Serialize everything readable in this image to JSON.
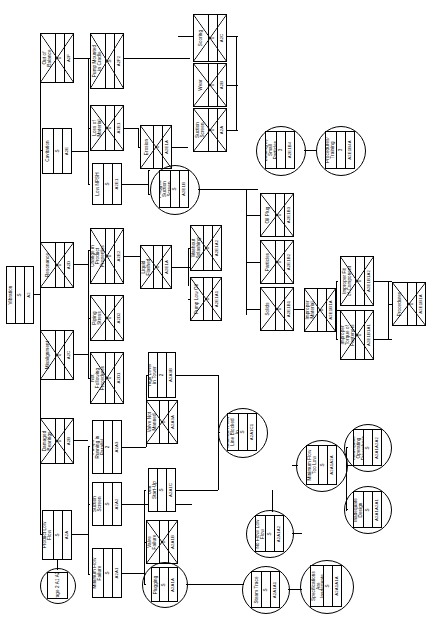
{
  "diagram": {
    "orientation": "landscape-rotated-text",
    "root": {
      "name": "Vibration",
      "rank": "S",
      "code": "A2"
    },
    "nodes": [
      {
        "id": "n_root",
        "name": "Vibration",
        "rank": "S",
        "code": "A2",
        "shape": "rect",
        "crossed": false,
        "x": 6,
        "y": 266,
        "w": 28,
        "h": 58
      },
      {
        "id": "n_c2_1",
        "name": "Out of Balance",
        "rank": "0",
        "code": "A2F",
        "shape": "rect",
        "crossed": true,
        "x": 40,
        "y": 33,
        "w": 34,
        "h": 50
      },
      {
        "id": "n_c2_2",
        "name": "Cavitation",
        "rank": "S",
        "code": "A2E",
        "shape": "rect",
        "crossed": false,
        "x": 42,
        "y": 128,
        "w": 30,
        "h": 46
      },
      {
        "id": "n_c2_3",
        "name": "Resonance",
        "rank": "0",
        "code": "A2D",
        "shape": "rect",
        "crossed": true,
        "x": 40,
        "y": 242,
        "w": 34,
        "h": 46
      },
      {
        "id": "n_c2_4",
        "name": "Misalignment",
        "rank": "0",
        "code": "A2C",
        "shape": "rect",
        "crossed": true,
        "x": 40,
        "y": 330,
        "w": 34,
        "h": 50
      },
      {
        "id": "n_c2_5",
        "name": "Damaged Bearings",
        "rank": "0",
        "code": "A2B",
        "shape": "rect",
        "crossed": true,
        "x": 40,
        "y": 418,
        "w": 34,
        "h": 46
      },
      {
        "id": "n_c2_6",
        "name": "Product Low Flow",
        "rank": "S",
        "code": "A2A",
        "shape": "rect",
        "crossed": false,
        "x": 42,
        "y": 510,
        "w": 30,
        "h": 50
      },
      {
        "id": "n_page2",
        "name": "Page 2 A1 A2",
        "rank": "",
        "code": "",
        "shape": "circle",
        "crossed": false,
        "x": 40,
        "y": 568,
        "w": 34,
        "h": 34
      },
      {
        "id": "n_c3_1",
        "name": "Pump Mounted in Cradle",
        "rank": "S",
        "code": "A2F2",
        "shape": "rect",
        "crossed": true,
        "x": 90,
        "y": 33,
        "w": 34,
        "h": 56
      },
      {
        "id": "n_c3_2",
        "name": "Loss of Material",
        "rank": "0",
        "code": "A2E1",
        "shape": "rect",
        "crossed": true,
        "x": 90,
        "y": 105,
        "w": 34,
        "h": 46
      },
      {
        "id": "n_c3_3",
        "name": "Low NPSH",
        "rank": "S",
        "code": "A2E1",
        "shape": "rect",
        "crossed": false,
        "x": 92,
        "y": 163,
        "w": 30,
        "h": 42
      },
      {
        "id": "n_c3_4",
        "name": "Change in Product Properties",
        "rank": "0",
        "code": "A2E2",
        "shape": "rect",
        "crossed": true,
        "x": 90,
        "y": 228,
        "w": 34,
        "h": 56
      },
      {
        "id": "n_c3_5",
        "name": "Piping Stress",
        "rank": "0",
        "code": "A2D2",
        "shape": "rect",
        "crossed": true,
        "x": 90,
        "y": 295,
        "w": 34,
        "h": 46
      },
      {
        "id": "n_c3_6",
        "name": "Not Following Procedures",
        "rank": "0",
        "code": "A2D1",
        "shape": "rect",
        "crossed": true,
        "x": 90,
        "y": 352,
        "w": 34,
        "h": 52
      },
      {
        "id": "n_c3_7",
        "name": "Pumps Running in Parallel",
        "rank": "2",
        "code": "A2A3",
        "shape": "rect",
        "crossed": false,
        "x": 92,
        "y": 420,
        "w": 30,
        "h": 54
      },
      {
        "id": "n_c3_8",
        "name": "Suction Screen",
        "rank": "S",
        "code": "A2A2",
        "shape": "rect",
        "crossed": false,
        "x": 92,
        "y": 482,
        "w": 30,
        "h": 44
      },
      {
        "id": "n_c3_9",
        "name": "Minimum Flow Failure",
        "rank": "S",
        "code": "A2A1",
        "shape": "rect",
        "crossed": false,
        "x": 92,
        "y": 548,
        "w": 30,
        "h": 50
      },
      {
        "id": "n_c4_1",
        "name": "Erosion",
        "rank": "0",
        "code": "A2E1A",
        "shape": "rect",
        "crossed": true,
        "x": 140,
        "y": 125,
        "w": 32,
        "h": 44
      },
      {
        "id": "n_c4_2",
        "name": "Plugged Suction Screen",
        "rank": "S",
        "code": "A2E1B",
        "shape": "circle",
        "crossed": false,
        "x": 150,
        "y": 165,
        "w": 48,
        "h": 48
      },
      {
        "id": "n_c4_3",
        "name": "Liquid Flashed",
        "rank": "0",
        "code": "A2E1A",
        "shape": "rect",
        "crossed": true,
        "x": 140,
        "y": 245,
        "w": 32,
        "h": 44
      },
      {
        "id": "n_c4_4",
        "name": "High Level in Tower",
        "rank": "2",
        "code": "A2A3B",
        "shape": "rect",
        "crossed": false,
        "x": 148,
        "y": 352,
        "w": 28,
        "h": 46
      },
      {
        "id": "n_c4_5",
        "name": "Valve Not Manned",
        "rank": "0",
        "code": "A2A3A",
        "shape": "rect",
        "crossed": true,
        "x": 146,
        "y": 400,
        "w": 32,
        "h": 44
      },
      {
        "id": "n_c4_6",
        "name": "Unit Start-Up",
        "rank": "S",
        "code": "A2A1C",
        "shape": "rect",
        "crossed": false,
        "x": 148,
        "y": 468,
        "w": 28,
        "h": 44
      },
      {
        "id": "n_c4_7",
        "name": "Valve Failure",
        "rank": "0",
        "code": "A2A1B",
        "shape": "rect",
        "crossed": true,
        "x": 146,
        "y": 520,
        "w": 32,
        "h": 44
      },
      {
        "id": "n_c4_8",
        "name": "Plugging",
        "rank": "S",
        "code": "A2A1A",
        "shape": "circle",
        "crossed": false,
        "x": 142,
        "y": 562,
        "w": 44,
        "h": 44
      },
      {
        "id": "n_c5_1",
        "name": "Washout Splashing",
        "rank": "0",
        "code": "A2E1A2",
        "shape": "rect",
        "crossed": true,
        "x": 190,
        "y": 225,
        "w": 32,
        "h": 46
      },
      {
        "id": "n_c5_2",
        "name": "Pump Low Oil",
        "rank": "0",
        "code": "A2E1A1",
        "shape": "rect",
        "crossed": true,
        "x": 190,
        "y": 277,
        "w": 32,
        "h": 44
      },
      {
        "id": "n_c5_3",
        "name": "Minimum Flow Line Blocked In",
        "rank": "S",
        "code": "A2A1C1",
        "shape": "circle",
        "crossed": false,
        "x": 218,
        "y": 408,
        "w": 48,
        "h": 48
      },
      {
        "id": "n_c6_1",
        "name": "Scoring",
        "rank": "0",
        "code": "A2C",
        "shape": "rect",
        "crossed": true,
        "x": 193,
        "y": 14,
        "w": 34,
        "h": 48
      },
      {
        "id": "n_c6_2",
        "name": "Wear",
        "rank": "0",
        "code": "A2B",
        "shape": "rect",
        "crossed": true,
        "x": 193,
        "y": 63,
        "w": 34,
        "h": 44
      },
      {
        "id": "n_c6_3",
        "name": "Suction Screen",
        "rank": "0",
        "code": "A2A",
        "shape": "rect",
        "crossed": true,
        "x": 193,
        "y": 108,
        "w": 34,
        "h": 44
      },
      {
        "id": "n_c7_1",
        "name": "Binding by Small Particles",
        "rank": "3",
        "code": "A2E1B4",
        "shape": "circle",
        "crossed": false,
        "x": 256,
        "y": 126,
        "w": 48,
        "h": 48
      },
      {
        "id": "n_c7_2",
        "name": "Procedures/ Training",
        "rank": "3",
        "code": "A2E1B4A",
        "shape": "circle",
        "crossed": false,
        "x": 316,
        "y": 126,
        "w": 48,
        "h": 48
      },
      {
        "id": "n_c8_1",
        "name": "Oil Plug",
        "rank": "0",
        "code": "A2E1B3",
        "shape": "rect",
        "crossed": true,
        "x": 260,
        "y": 193,
        "w": 34,
        "h": 44
      },
      {
        "id": "n_c8_2",
        "name": "Particles",
        "rank": "0",
        "code": "A2E1B2",
        "shape": "rect",
        "crossed": true,
        "x": 260,
        "y": 240,
        "w": 34,
        "h": 44
      },
      {
        "id": "n_c8_3",
        "name": "Solids",
        "rank": "0",
        "code": "A2E1B1",
        "shape": "rect",
        "crossed": true,
        "x": 260,
        "y": 287,
        "w": 34,
        "h": 44
      },
      {
        "id": "n_c9_1",
        "name": "Improper Material",
        "rank": "0",
        "code": "A2E1B1A",
        "shape": "rect",
        "crossed": true,
        "x": 304,
        "y": 288,
        "w": 32,
        "h": 44
      },
      {
        "id": "n_c9_2",
        "name": "Improper Fit of Component",
        "rank": "0",
        "code": "A2E1B1A2",
        "shape": "rect",
        "crossed": true,
        "x": 340,
        "y": 256,
        "w": 34,
        "h": 50
      },
      {
        "id": "n_c9_3",
        "name": "Improper Torque of Fasteners",
        "rank": "0",
        "code": "A2E1B1A1",
        "shape": "rect",
        "crossed": true,
        "x": 340,
        "y": 310,
        "w": 34,
        "h": 50
      },
      {
        "id": "n_c9_4",
        "name": "Procedures",
        "rank": "0",
        "code": "A2E1B1A",
        "shape": "rect",
        "crossed": true,
        "x": 392,
        "y": 282,
        "w": 34,
        "h": 44
      },
      {
        "id": "n_c10_1",
        "name": "Minimum Flow Too Low",
        "rank": "S",
        "code": "A2A1A2A",
        "shape": "circle",
        "crossed": false,
        "x": 296,
        "y": 440,
        "w": 50,
        "h": 50
      },
      {
        "id": "n_c10_2",
        "name": "Inadequate Operating Procedures",
        "rank": "S",
        "code": "A2A1A2A2",
        "shape": "circle",
        "crossed": false,
        "x": 344,
        "y": 424,
        "w": 46,
        "h": 46
      },
      {
        "id": "n_c10_3",
        "name": "Inadequate Design",
        "rank": "S",
        "code": "A2A1A2A1",
        "shape": "circle",
        "crossed": false,
        "x": 344,
        "y": 486,
        "w": 46,
        "h": 46
      },
      {
        "id": "n_c11_1",
        "name": "No Flow/ Low Flow",
        "rank": "S",
        "code": "A2A1A2",
        "shape": "circle",
        "crossed": false,
        "x": 246,
        "y": 510,
        "w": 46,
        "h": 46
      },
      {
        "id": "n_c11_2",
        "name": "Steam Trace",
        "rank": "S",
        "code": "A2A1A1",
        "shape": "circle",
        "crossed": false,
        "x": 242,
        "y": 566,
        "w": 46,
        "h": 46
      },
      {
        "id": "n_c11_3",
        "name": "Tracing Specifications Are Inadequate",
        "rank": "S",
        "code": "A2A1A1A",
        "shape": "circle",
        "crossed": false,
        "x": 300,
        "y": 560,
        "w": 52,
        "h": 52
      }
    ],
    "legend": {
      "rank_values": [
        "S",
        "0",
        "1",
        "2",
        "3"
      ],
      "note": "Each node shows a description, a ranking value and an event code."
    }
  }
}
